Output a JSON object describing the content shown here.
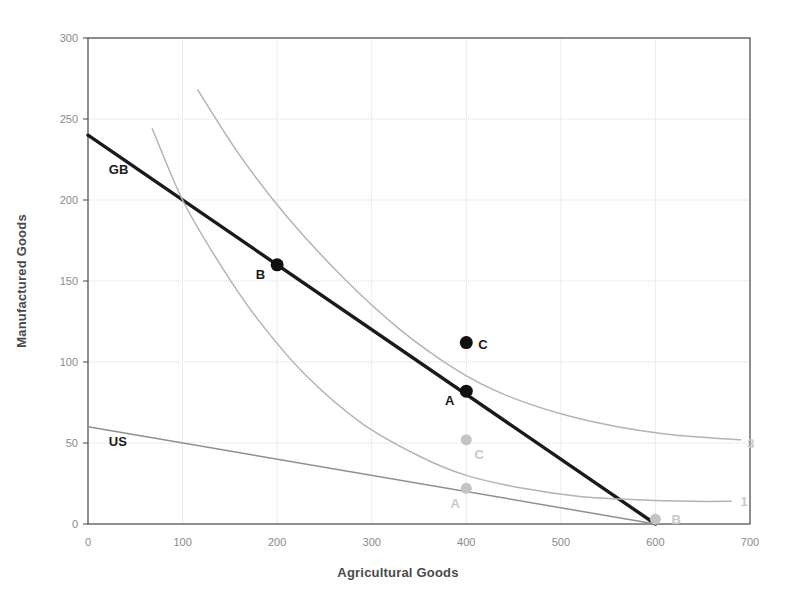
{
  "chart_data": {
    "type": "line",
    "title": "",
    "xlabel": "Agricultural Goods",
    "ylabel": "Manufactured Goods",
    "xlim": [
      0,
      700
    ],
    "ylim": [
      0,
      300
    ],
    "xticks": [
      0,
      100,
      200,
      300,
      400,
      500,
      600,
      700
    ],
    "yticks": [
      0,
      50,
      100,
      150,
      200,
      250,
      300
    ],
    "xtick_labels": [
      "0",
      "100",
      "200",
      "300",
      "400",
      "500",
      "600",
      "700"
    ],
    "ytick_labels": [
      "0",
      "50",
      "100",
      "150",
      "200",
      "250",
      "300"
    ],
    "grid": true,
    "legend": "none",
    "series": [
      {
        "name": "GB",
        "label": "GB",
        "style": "solid-thick-black",
        "color": "#1a1a1a",
        "points": [
          [
            0,
            240
          ],
          [
            600,
            0
          ]
        ]
      },
      {
        "name": "US",
        "label": "US",
        "style": "solid-thin-gray",
        "color": "#8f8f8f",
        "points": [
          [
            0,
            60
          ],
          [
            600,
            0
          ]
        ]
      },
      {
        "name": "indifference-curve-1",
        "label": "1",
        "style": "solid-thin-gray",
        "color": "#b4b4b4",
        "points": [
          [
            68,
            244
          ],
          [
            100,
            200
          ],
          [
            140,
            160
          ],
          [
            180,
            126
          ],
          [
            230,
            92
          ],
          [
            290,
            62
          ],
          [
            350,
            42
          ],
          [
            400,
            30
          ],
          [
            460,
            22
          ],
          [
            520,
            17
          ],
          [
            580,
            15
          ],
          [
            640,
            14
          ],
          [
            680,
            14
          ]
        ]
      },
      {
        "name": "indifference-curve-3",
        "label": "3",
        "style": "solid-thin-gray",
        "color": "#b4b4b4",
        "points": [
          [
            116,
            268
          ],
          [
            160,
            228
          ],
          [
            210,
            190
          ],
          [
            270,
            152
          ],
          [
            330,
            120
          ],
          [
            390,
            95
          ],
          [
            440,
            80
          ],
          [
            500,
            68
          ],
          [
            560,
            60
          ],
          [
            620,
            55
          ],
          [
            690,
            52
          ]
        ]
      }
    ],
    "points_dark": [
      {
        "label": "A",
        "x": 400,
        "y": 82,
        "label_pos": "left",
        "color": "#111111"
      },
      {
        "label": "B",
        "x": 200,
        "y": 160,
        "label_pos": "left",
        "color": "#111111"
      },
      {
        "label": "C",
        "x": 400,
        "y": 112,
        "label_pos": "right",
        "color": "#111111"
      }
    ],
    "points_light": [
      {
        "label": "A",
        "x": 400,
        "y": 22,
        "label_pos": "below-left",
        "color": "#c4c4c4"
      },
      {
        "label": "B",
        "x": 600,
        "y": 3,
        "label_pos": "right",
        "color": "#c4c4c4"
      },
      {
        "label": "C",
        "x": 400,
        "y": 52,
        "label_pos": "below-right",
        "color": "#c4c4c4"
      }
    ],
    "curve_end_labels": [
      {
        "label": "3",
        "x": 697,
        "y": 50
      },
      {
        "label": "1",
        "x": 690,
        "y": 14
      }
    ],
    "line_labels": [
      {
        "label": "GB",
        "x": 22,
        "y": 216
      },
      {
        "label": "US",
        "x": 22,
        "y": 48
      }
    ]
  },
  "colors": {
    "axis": "#555555",
    "grid": "#d8d8d8",
    "tick_text": "#8a8a8a",
    "axis_title": "#4a4a4a",
    "dark_series": "#1a1a1a",
    "light_series": "#b4b4b4",
    "background": "#ffffff"
  }
}
